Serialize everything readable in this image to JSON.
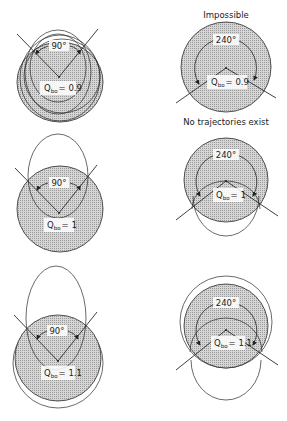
{
  "figure": {
    "panels": [
      {
        "id": "tl",
        "q_label": "Q",
        "q_sub": "bo",
        "q_value": "= 0.9",
        "angle": "90°"
      },
      {
        "id": "tr",
        "q_label": "Q",
        "q_sub": "bo",
        "q_value": "= 0.9",
        "angle": "240°",
        "top_caption": "Impossible",
        "bottom_caption": "No trajectories exist"
      },
      {
        "id": "ml",
        "q_label": "Q",
        "q_sub": "bo",
        "q_value": "= 1",
        "angle": "90°"
      },
      {
        "id": "mr",
        "q_label": "Q",
        "q_sub": "bo",
        "q_value": "= 1",
        "angle": "240°"
      },
      {
        "id": "bl",
        "q_label": "Q",
        "q_sub": "bo",
        "q_value": "= 1.1",
        "angle": "90°"
      },
      {
        "id": "br",
        "q_label": "Q",
        "q_sub": "bo",
        "q_value": "= 1.1",
        "angle": "240°"
      }
    ]
  },
  "colors": {
    "shade": "#c8c8c8",
    "stroke": "#2a2a2a"
  }
}
